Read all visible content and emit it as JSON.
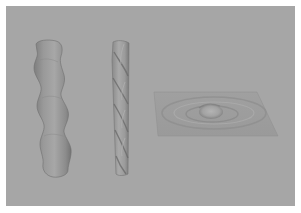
{
  "image": {
    "background_color": "#a6a6a6",
    "border_color": "#ffffff",
    "objects": [
      {
        "name": "wavy-tube",
        "description": "Vertical tube with sinusoidal bulging surface",
        "color": "#9a9a9a"
      },
      {
        "name": "twisted-rod",
        "description": "Vertical rod with helical twist grooves",
        "color": "#a3a3a3"
      },
      {
        "name": "ripple-plane",
        "description": "Flat square plane with concentric ripple and central bump",
        "color": "#9d9d9d"
      }
    ]
  }
}
